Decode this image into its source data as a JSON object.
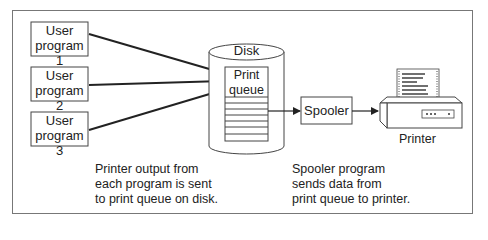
{
  "diagram": {
    "user_programs": [
      {
        "label_line1": "User",
        "label_line2": "program 1"
      },
      {
        "label_line1": "User",
        "label_line2": "program 2"
      },
      {
        "label_line1": "User",
        "label_line2": "program 3"
      }
    ],
    "disk": {
      "label": "Disk"
    },
    "print_queue": {
      "label_line1": "Print",
      "label_line2": "queue"
    },
    "spooler": {
      "label": "Spooler"
    },
    "printer": {
      "label": "Printer"
    },
    "captions": {
      "left": "Printer output from\neach program is sent\nto print queue on disk.",
      "right": "Spooler program\nsends data from\nprint queue to printer."
    },
    "colors": {
      "stroke": "#333333",
      "frame": "#777777",
      "background": "#ffffff"
    }
  }
}
